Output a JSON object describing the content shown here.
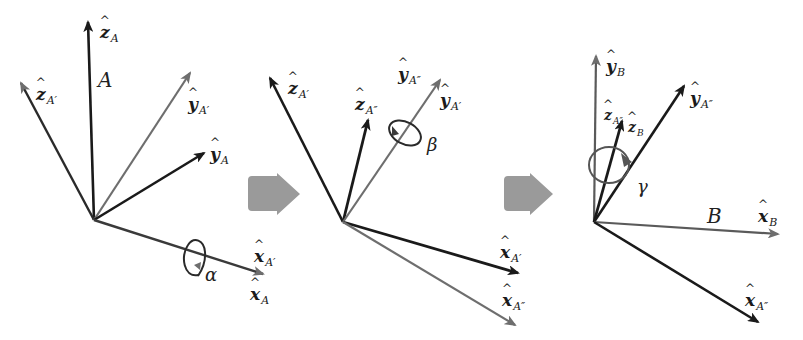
{
  "diagram": {
    "colors": {
      "dark_axis": "#1a1a1a",
      "gray_axis": "#6e6e6e",
      "step_arrow": "#9a9a9a",
      "background": "#ffffff"
    },
    "step_arrows": [
      {
        "from": "panel-1",
        "to": "panel-2"
      },
      {
        "from": "panel-2",
        "to": "panel-3"
      }
    ],
    "panels": [
      {
        "id": "panel-1",
        "frame_name": "A",
        "rotation": {
          "about": "x_A",
          "angle": "α"
        },
        "axes": [
          {
            "base": "z",
            "sub": "A",
            "label_hat": "ẑ"
          },
          {
            "base": "z",
            "sub": "A′",
            "label_hat": "ẑ"
          },
          {
            "base": "y",
            "sub": "A′",
            "label_hat": "ŷ"
          },
          {
            "base": "y",
            "sub": "A",
            "label_hat": "ŷ"
          },
          {
            "base": "x",
            "sub": "A′",
            "label_hat": "x̂"
          },
          {
            "base": "x",
            "sub": "A",
            "label_hat": "x̂"
          }
        ]
      },
      {
        "id": "panel-2",
        "frame_name": "",
        "rotation": {
          "about": "y_A'",
          "angle": "β"
        },
        "axes": [
          {
            "base": "z",
            "sub": "A′",
            "label_hat": "ẑ"
          },
          {
            "base": "z",
            "sub": "A″",
            "label_hat": "ẑ"
          },
          {
            "base": "y",
            "sub": "A″",
            "label_hat": "ŷ"
          },
          {
            "base": "y",
            "sub": "A′",
            "label_hat": "ŷ"
          },
          {
            "base": "x",
            "sub": "A′",
            "label_hat": "x̂"
          },
          {
            "base": "x",
            "sub": "A″",
            "label_hat": "x̂"
          }
        ]
      },
      {
        "id": "panel-3",
        "frame_name": "B",
        "rotation": {
          "about": "z_A''",
          "angle": "γ"
        },
        "axes": [
          {
            "base": "y",
            "sub": "B",
            "label_hat": "ŷ"
          },
          {
            "base": "z",
            "sub": "A″",
            "label_hat": "ẑ"
          },
          {
            "base": "z",
            "sub": "B",
            "label_hat": "ẑ"
          },
          {
            "base": "y",
            "sub": "A″",
            "label_hat": "ŷ"
          },
          {
            "base": "x",
            "sub": "B",
            "label_hat": "x̂"
          },
          {
            "base": "x",
            "sub": "A″",
            "label_hat": "x̂"
          }
        ]
      }
    ]
  }
}
